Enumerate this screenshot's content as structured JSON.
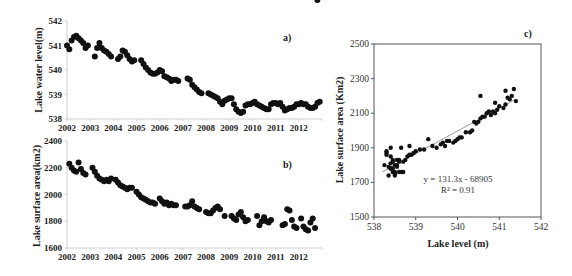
{
  "chart_data": [
    {
      "id": "a",
      "type": "scatter",
      "panel_label": "a)",
      "title": "",
      "xlabel": "",
      "ylabel": "Lake water level(m)",
      "x_tick_labels": [
        "2002",
        "2003",
        "2004",
        "2005",
        "2006",
        "2007",
        "2008",
        "2009",
        "2010",
        "2011",
        "2012"
      ],
      "y_ticks": [
        538,
        539,
        540,
        541,
        542
      ],
      "xlim": [
        2002.0,
        2013.0
      ],
      "ylim": [
        538,
        542
      ],
      "grid": false,
      "series": [
        {
          "name": "Lake water level",
          "x": [
            2002.0,
            2002.1,
            2002.2,
            2002.3,
            2002.4,
            2002.5,
            2002.6,
            2002.7,
            2002.8,
            2002.9,
            2003.2,
            2003.3,
            2003.4,
            2003.5,
            2003.6,
            2003.7,
            2003.8,
            2003.9,
            2004.2,
            2004.3,
            2004.4,
            2004.5,
            2004.6,
            2004.7,
            2004.8,
            2004.9,
            2005.2,
            2005.3,
            2005.4,
            2005.5,
            2005.6,
            2005.7,
            2005.8,
            2005.9,
            2006.0,
            2006.1,
            2006.2,
            2006.3,
            2006.4,
            2006.5,
            2006.6,
            2006.7,
            2006.8,
            2007.2,
            2007.3,
            2007.4,
            2007.5,
            2007.6,
            2007.7,
            2007.8,
            2008.1,
            2008.2,
            2008.3,
            2008.4,
            2008.5,
            2008.6,
            2008.7,
            2008.8,
            2008.9,
            2009.0,
            2009.1,
            2009.2,
            2009.3,
            2009.4,
            2009.5,
            2009.6,
            2009.7,
            2009.8,
            2009.9,
            2010.0,
            2010.1,
            2010.2,
            2010.3,
            2010.4,
            2010.5,
            2010.6,
            2010.7,
            2010.8,
            2010.9,
            2011.0,
            2011.1,
            2011.2,
            2011.3,
            2011.4,
            2011.5,
            2011.6,
            2011.7,
            2011.8,
            2011.9,
            2012.0,
            2012.1,
            2012.2,
            2012.3,
            2012.4,
            2012.5,
            2012.6,
            2012.7,
            2012.8,
            2012.9
          ],
          "y": [
            541.0,
            540.85,
            541.2,
            541.35,
            541.4,
            541.3,
            541.2,
            541.1,
            540.9,
            541.0,
            540.55,
            540.9,
            541.1,
            540.9,
            540.8,
            540.75,
            540.65,
            540.55,
            540.45,
            540.55,
            540.8,
            540.75,
            540.6,
            540.45,
            540.35,
            540.4,
            540.4,
            540.25,
            540.1,
            540.0,
            539.9,
            539.85,
            539.85,
            539.9,
            540.0,
            539.95,
            539.75,
            539.7,
            539.65,
            539.55,
            539.6,
            539.6,
            539.55,
            539.65,
            539.6,
            539.4,
            539.3,
            539.2,
            539.1,
            539.05,
            539.05,
            539.0,
            538.95,
            538.9,
            538.85,
            538.7,
            538.6,
            538.75,
            538.8,
            538.85,
            538.85,
            538.6,
            538.4,
            538.3,
            538.25,
            538.3,
            538.55,
            538.6,
            538.6,
            538.65,
            538.7,
            538.6,
            538.55,
            538.5,
            538.45,
            538.4,
            538.4,
            538.6,
            538.65,
            538.65,
            538.6,
            538.65,
            538.5,
            538.35,
            538.4,
            538.45,
            538.45,
            538.5,
            538.6,
            538.6,
            538.65,
            538.6,
            538.6,
            538.5,
            538.45,
            538.45,
            538.5,
            538.65,
            538.7
          ]
        }
      ]
    },
    {
      "id": "b",
      "type": "scatter",
      "panel_label": "b)",
      "title": "",
      "xlabel": "",
      "ylabel": "Lake surface area(km2)",
      "x_tick_labels": [
        "2002",
        "2003",
        "2004",
        "2005",
        "2006",
        "2007",
        "2008",
        "2009",
        "2010",
        "2011",
        "2012"
      ],
      "y_ticks": [
        1600,
        1800,
        2000,
        2200,
        2400
      ],
      "xlim": [
        2002.0,
        2013.0
      ],
      "ylim": [
        1600,
        2400
      ],
      "grid": false,
      "series": [
        {
          "name": "Lake surface area",
          "x": [
            2002.1,
            2002.2,
            2002.3,
            2002.4,
            2002.5,
            2002.6,
            2002.7,
            2002.8,
            2003.1,
            2003.2,
            2003.3,
            2003.4,
            2003.5,
            2003.6,
            2003.7,
            2003.8,
            2003.9,
            2004.1,
            2004.2,
            2004.3,
            2004.4,
            2004.5,
            2004.6,
            2004.7,
            2004.8,
            2005.0,
            2005.1,
            2005.2,
            2005.3,
            2005.4,
            2005.5,
            2005.6,
            2005.7,
            2005.8,
            2006.0,
            2006.1,
            2006.2,
            2006.3,
            2006.4,
            2006.5,
            2006.6,
            2006.7,
            2007.1,
            2007.2,
            2007.3,
            2007.4,
            2007.5,
            2007.6,
            2007.7,
            2008.0,
            2008.1,
            2008.2,
            2008.3,
            2008.4,
            2008.5,
            2008.6,
            2008.8,
            2009.1,
            2009.2,
            2009.3,
            2009.4,
            2009.5,
            2009.6,
            2009.7,
            2009.8,
            2010.2,
            2010.3,
            2010.4,
            2010.5,
            2010.6,
            2010.7,
            2010.8,
            2011.3,
            2011.4,
            2011.5,
            2011.6,
            2011.7,
            2011.8,
            2011.9,
            2012.1,
            2012.2,
            2012.3,
            2012.4,
            2012.5,
            2012.6,
            2012.7,
            2012.8
          ],
          "y": [
            2230,
            2200,
            2180,
            2170,
            2240,
            2190,
            2160,
            2150,
            2200,
            2170,
            2140,
            2120,
            2110,
            2100,
            2110,
            2100,
            2120,
            2110,
            2090,
            2070,
            2060,
            2050,
            2040,
            2050,
            2050,
            2020,
            2000,
            1980,
            1970,
            1960,
            1950,
            1940,
            1940,
            1930,
            1970,
            1950,
            1930,
            1940,
            1920,
            1930,
            1920,
            1920,
            1910,
            1910,
            1920,
            1950,
            1910,
            1900,
            1890,
            1870,
            1860,
            1860,
            1880,
            1900,
            1910,
            1890,
            1840,
            1840,
            1820,
            1810,
            1850,
            1870,
            1830,
            1800,
            1810,
            1840,
            1770,
            1800,
            1830,
            1800,
            1790,
            1810,
            1770,
            1780,
            1890,
            1880,
            1810,
            1760,
            1750,
            1820,
            1760,
            1740,
            1730,
            1790,
            1820,
            1750
          ]
        }
      ]
    },
    {
      "id": "c",
      "type": "scatter",
      "panel_label": "c)",
      "title": "",
      "xlabel": "Lake level (m)",
      "ylabel": "Lake surface area (Km2)",
      "x_ticks": [
        538,
        539,
        540,
        541,
        542
      ],
      "y_ticks": [
        1500,
        1700,
        1900,
        2100,
        2300,
        2500
      ],
      "xlim": [
        538,
        542
      ],
      "ylim": [
        1500,
        2500
      ],
      "grid": false,
      "annotations": [
        "y = 131.3x - 68905",
        "R² = 0.91"
      ],
      "trendline": {
        "slope": 131.3,
        "intercept": -68905,
        "x_range": [
          538.2,
          541.4
        ],
        "r2": 0.91
      },
      "series": [
        {
          "name": "Area vs level",
          "x": [
            538.25,
            538.3,
            538.35,
            538.4,
            538.4,
            538.45,
            538.45,
            538.5,
            538.5,
            538.55,
            538.6,
            538.65,
            538.7,
            538.35,
            538.4,
            538.45,
            538.5,
            538.55,
            538.6,
            538.3,
            538.4,
            538.45,
            538.5,
            538.55,
            538.6,
            538.7,
            538.75,
            538.8,
            538.85,
            538.9,
            538.95,
            539.0,
            539.1,
            539.2,
            539.3,
            538.65,
            538.85,
            538.4,
            538.3,
            539.4,
            539.5,
            539.6,
            539.65,
            539.7,
            539.75,
            539.8,
            539.9,
            539.95,
            540.0,
            540.05,
            540.1,
            540.2,
            540.3,
            540.35,
            540.4,
            540.45,
            540.5,
            540.55,
            540.6,
            540.65,
            540.7,
            540.75,
            540.8,
            540.85,
            540.9,
            540.95,
            541.0,
            541.1,
            541.15,
            541.2,
            541.25,
            541.3,
            541.35,
            541.4,
            540.55,
            540.9,
            541.15
          ],
          "y": [
            1800,
            1870,
            1790,
            1780,
            1810,
            1760,
            1820,
            1750,
            1800,
            1830,
            1830,
            1760,
            1760,
            1740,
            1780,
            1830,
            1740,
            1790,
            1820,
            1860,
            1850,
            1780,
            1760,
            1800,
            1760,
            1820,
            1830,
            1850,
            1860,
            1860,
            1870,
            1880,
            1890,
            1890,
            1950,
            1900,
            1910,
            1900,
            1880,
            1910,
            1900,
            1920,
            1930,
            1910,
            1940,
            1940,
            1930,
            1940,
            1950,
            1960,
            1960,
            1990,
            1990,
            2000,
            2050,
            2040,
            2050,
            2070,
            2080,
            2080,
            2100,
            2110,
            2090,
            2110,
            2100,
            2120,
            2140,
            2130,
            2150,
            2190,
            2180,
            2200,
            2240,
            2170,
            2200,
            2160,
            2230
          ]
        }
      ]
    }
  ]
}
